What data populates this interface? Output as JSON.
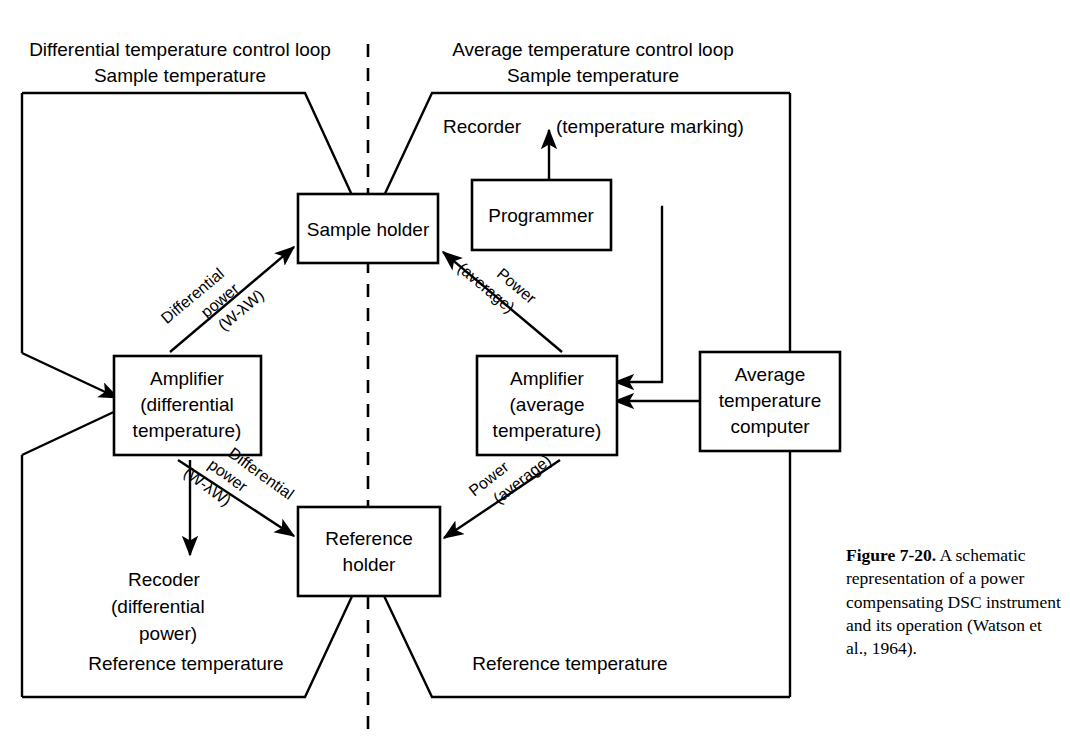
{
  "figure": {
    "number_label": "Figure 7-20.",
    "caption_body": " A schematic representation of a power compensating DSC instrument and its operation (Watson et al., 1964).",
    "caption_full": "Figure 7-20. A schematic representation of a power compensating DSC instrument and its operation (Watson et al., 1964)."
  },
  "headers": {
    "left_loop": "Differential temperature control loop",
    "left_loop_sub": "Sample temperature",
    "right_loop": "Average temperature control loop",
    "right_loop_sub": "Sample temperature"
  },
  "footers": {
    "left": "Reference temperature",
    "right": "Reference temperature"
  },
  "boxes": {
    "sample_holder": {
      "label": "Sample holder"
    },
    "programmer": {
      "label": "Programmer"
    },
    "amplifier_diff": {
      "line1": "Amplifier",
      "line2": "(differential",
      "line3": "temperature)"
    },
    "amplifier_avg": {
      "line1": "Amplifier",
      "line2": "(average",
      "line3": "temperature)"
    },
    "avg_temp_computer": {
      "line1": "Average",
      "line2": "temperature",
      "line3": "computer"
    },
    "reference_holder": {
      "line1": "Reference",
      "line2": "holder"
    }
  },
  "labels": {
    "recorder_temp": "Recorder",
    "temperature_marking": "(temperature marking)",
    "recoder_diff_l1": "Recoder",
    "recoder_diff_l2": "(differential",
    "recoder_diff_l3": "power)",
    "diff_power_top_1": "Differential",
    "diff_power_top_2": "power",
    "diff_power_top_3": "(W-λW)",
    "power_avg_top_1": "Power",
    "power_avg_top_2": "(average)",
    "diff_power_bot_1": "Differential",
    "diff_power_bot_2": "power",
    "diff_power_bot_3": "(W-λW)",
    "power_avg_bot_1": "Power",
    "power_avg_bot_2": "(average)"
  },
  "colors": {
    "ink": "#000000",
    "paper": "#ffffff"
  }
}
